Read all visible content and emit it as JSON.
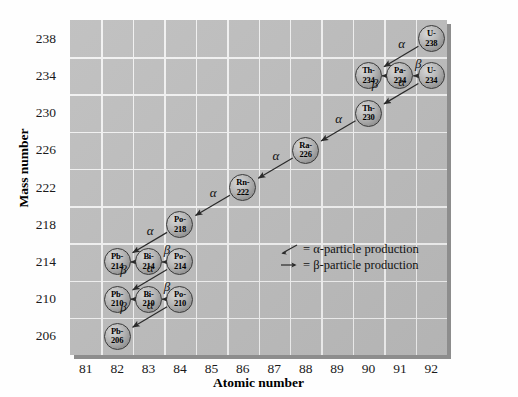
{
  "chart_data": {
    "type": "scatter",
    "title": "",
    "xlabel": "Atomic number",
    "ylabel": "Mass number",
    "xlim": [
      80.5,
      92.5
    ],
    "ylim": [
      204,
      240
    ],
    "xticks": [
      81,
      82,
      83,
      84,
      85,
      86,
      87,
      88,
      89,
      90,
      91,
      92
    ],
    "yticks": [
      206,
      210,
      214,
      218,
      222,
      226,
      230,
      234,
      238
    ],
    "grid": true,
    "legend_position": "inside-center-right",
    "nodes": [
      {
        "id": "U-238",
        "element": "U-",
        "mass": "238",
        "atomic_number": 92,
        "mass_number": 238
      },
      {
        "id": "Th-234",
        "element": "Th-",
        "mass": "234",
        "atomic_number": 90,
        "mass_number": 234
      },
      {
        "id": "Pa-234",
        "element": "Pa-",
        "mass": "234",
        "atomic_number": 91,
        "mass_number": 234
      },
      {
        "id": "U-234",
        "element": "U-",
        "mass": "234",
        "atomic_number": 92,
        "mass_number": 234
      },
      {
        "id": "Th-230",
        "element": "Th-",
        "mass": "230",
        "atomic_number": 90,
        "mass_number": 230
      },
      {
        "id": "Ra-226",
        "element": "Ra-",
        "mass": "226",
        "atomic_number": 88,
        "mass_number": 226
      },
      {
        "id": "Rn-222",
        "element": "Rn-",
        "mass": "222",
        "atomic_number": 86,
        "mass_number": 222
      },
      {
        "id": "Po-218",
        "element": "Po-",
        "mass": "218",
        "atomic_number": 84,
        "mass_number": 218
      },
      {
        "id": "Pb-214",
        "element": "Pb-",
        "mass": "214",
        "atomic_number": 82,
        "mass_number": 214
      },
      {
        "id": "Bi-214",
        "element": "Bi-",
        "mass": "214",
        "atomic_number": 83,
        "mass_number": 214
      },
      {
        "id": "Po-214",
        "element": "Po-",
        "mass": "214",
        "atomic_number": 84,
        "mass_number": 214
      },
      {
        "id": "Pb-210",
        "element": "Pb-",
        "mass": "210",
        "atomic_number": 82,
        "mass_number": 210
      },
      {
        "id": "Bi-210",
        "element": "Bi-",
        "mass": "210",
        "atomic_number": 83,
        "mass_number": 210
      },
      {
        "id": "Po-210",
        "element": "Po-",
        "mass": "210",
        "atomic_number": 84,
        "mass_number": 210
      },
      {
        "id": "Pb-206",
        "element": "Pb-",
        "mass": "206",
        "atomic_number": 82,
        "mass_number": 206
      }
    ],
    "transitions": [
      {
        "from": "U-238",
        "to": "Th-234",
        "type": "alpha",
        "label": "α"
      },
      {
        "from": "Th-234",
        "to": "Pa-234",
        "type": "beta",
        "label": "β"
      },
      {
        "from": "Pa-234",
        "to": "U-234",
        "type": "beta",
        "label": "β"
      },
      {
        "from": "U-234",
        "to": "Th-230",
        "type": "alpha",
        "label": "α"
      },
      {
        "from": "Th-230",
        "to": "Ra-226",
        "type": "alpha",
        "label": "α"
      },
      {
        "from": "Ra-226",
        "to": "Rn-222",
        "type": "alpha",
        "label": "α"
      },
      {
        "from": "Rn-222",
        "to": "Po-218",
        "type": "alpha",
        "label": "α"
      },
      {
        "from": "Po-218",
        "to": "Pb-214",
        "type": "alpha",
        "label": "α"
      },
      {
        "from": "Pb-214",
        "to": "Bi-214",
        "type": "beta",
        "label": "β"
      },
      {
        "from": "Bi-214",
        "to": "Po-214",
        "type": "beta",
        "label": "β"
      },
      {
        "from": "Po-214",
        "to": "Pb-210",
        "type": "alpha",
        "label": "α"
      },
      {
        "from": "Pb-210",
        "to": "Bi-210",
        "type": "beta",
        "label": "β"
      },
      {
        "from": "Bi-210",
        "to": "Po-210",
        "type": "beta",
        "label": "β"
      },
      {
        "from": "Po-210",
        "to": "Pb-206",
        "type": "alpha",
        "label": "α"
      }
    ],
    "legend": [
      {
        "glyph": "alpha-arrow-icon",
        "text": "= α-particle production"
      },
      {
        "glyph": "beta-arrow-icon",
        "text": "= β-particle production"
      }
    ],
    "colors": {
      "plot_background": "#bdbdbd",
      "gridline": "#f2f2f2",
      "node_fill": "#b4b4b4",
      "node_border": "#3a3a3a",
      "arrow": "#2a2a2a",
      "page_background": "#fefefe",
      "text": "#111111"
    }
  }
}
